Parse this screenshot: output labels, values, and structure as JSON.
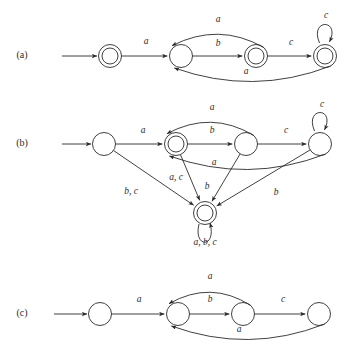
{
  "figure": {
    "background": "#ffffff",
    "ink": "#2b2b2b",
    "panels": [
      {
        "id": "a",
        "label": "(a)",
        "label_x": 22,
        "label_y": 56,
        "states": [
          {
            "name": "a-q0",
            "x": 110,
            "y": 56,
            "accepting": true
          },
          {
            "name": "a-q1",
            "x": 181,
            "y": 56,
            "accepting": false
          },
          {
            "name": "a-q2",
            "x": 256,
            "y": 56,
            "accepting": true
          },
          {
            "name": "a-q3",
            "x": 325,
            "y": 56,
            "accepting": true
          }
        ],
        "start_arrow": {
          "from_x": 62,
          "to_x": 97,
          "y": 56
        },
        "transitions": [
          {
            "name": "a-e1",
            "label": "a",
            "label_x": 146,
            "label_y": 42,
            "from": "a-q0",
            "to": "a-q1",
            "shape": "straight"
          },
          {
            "name": "a-e2",
            "label": "b",
            "label_x": 218,
            "label_y": 44,
            "from": "a-q1",
            "to": "a-q2",
            "shape": "straight"
          },
          {
            "name": "a-e3",
            "label": "c",
            "label_x": 291,
            "label_y": 43,
            "from": "a-q2",
            "to": "a-q3",
            "shape": "straight"
          },
          {
            "name": "a-e4",
            "label": "a",
            "label_x": 218,
            "label_y": 20,
            "from": "a-q2",
            "to": "a-q1",
            "shape": "arc-above"
          },
          {
            "name": "a-e5",
            "label": "a",
            "label_x": 246,
            "label_y": 72,
            "from": "a-q3",
            "to": "a-q1",
            "shape": "arc-below"
          },
          {
            "name": "a-e6",
            "label": "c",
            "label_x": 326,
            "label_y": 16,
            "from": "a-q3",
            "to": "a-q3",
            "shape": "self-loop-top"
          }
        ]
      },
      {
        "id": "b",
        "label": "(b)",
        "label_x": 22,
        "label_y": 144,
        "states": [
          {
            "name": "b-q0",
            "x": 104,
            "y": 144,
            "accepting": false
          },
          {
            "name": "b-q1",
            "x": 176,
            "y": 144,
            "accepting": true
          },
          {
            "name": "b-q2",
            "x": 246,
            "y": 144,
            "accepting": false
          },
          {
            "name": "b-q3",
            "x": 320,
            "y": 144,
            "accepting": false
          },
          {
            "name": "b-q4",
            "x": 205,
            "y": 213,
            "accepting": true
          }
        ],
        "start_arrow": {
          "from_x": 62,
          "to_x": 91,
          "y": 144
        },
        "transitions": [
          {
            "name": "b-e1",
            "label": "a",
            "label_x": 143,
            "label_y": 131,
            "from": "b-q0",
            "to": "b-q1",
            "shape": "straight"
          },
          {
            "name": "b-e2",
            "label": "b",
            "label_x": 212,
            "label_y": 131,
            "from": "b-q1",
            "to": "b-q2",
            "shape": "straight"
          },
          {
            "name": "b-e3",
            "label": "c",
            "label_x": 286,
            "label_y": 131,
            "from": "b-q2",
            "to": "b-q3",
            "shape": "straight"
          },
          {
            "name": "b-e4",
            "label": "a",
            "label_x": 212,
            "label_y": 108,
            "from": "b-q2",
            "to": "b-q1",
            "shape": "arc-above"
          },
          {
            "name": "b-e5",
            "label": "a",
            "label_x": 214,
            "label_y": 163,
            "from": "b-q3",
            "to": "b-q1",
            "shape": "arc-below"
          },
          {
            "name": "b-e6",
            "label": "c",
            "label_x": 322,
            "label_y": 105,
            "from": "b-q3",
            "to": "b-q3",
            "shape": "self-loop-top"
          },
          {
            "name": "b-e7",
            "label": "b, c",
            "label_x": 131,
            "label_y": 192,
            "from": "b-q0",
            "to": "b-q4",
            "shape": "straight"
          },
          {
            "name": "b-e8",
            "label": "a, c",
            "label_x": 176,
            "label_y": 178,
            "from": "b-q1",
            "to": "b-q4",
            "shape": "straight"
          },
          {
            "name": "b-e9",
            "label": "b",
            "label_x": 207,
            "label_y": 187,
            "from": "b-q2",
            "to": "b-q4",
            "shape": "straight"
          },
          {
            "name": "b-e10",
            "label": "b",
            "label_x": 276,
            "label_y": 193,
            "from": "b-q3",
            "to": "b-q4",
            "shape": "straight"
          },
          {
            "name": "b-e11",
            "label": "a, b, c",
            "label_x": 205,
            "label_y": 243,
            "from": "b-q4",
            "to": "b-q4",
            "shape": "self-loop-bottom"
          }
        ]
      },
      {
        "id": "c",
        "label": "(c)",
        "label_x": 22,
        "label_y": 314,
        "states": [
          {
            "name": "c-q0",
            "x": 100,
            "y": 314,
            "accepting": false
          },
          {
            "name": "c-q1",
            "x": 178,
            "y": 314,
            "accepting": false
          },
          {
            "name": "c-q2",
            "x": 243,
            "y": 314,
            "accepting": false
          },
          {
            "name": "c-q3",
            "x": 319,
            "y": 314,
            "accepting": false
          }
        ],
        "start_arrow": {
          "from_x": 54,
          "to_x": 87,
          "y": 314
        },
        "transitions": [
          {
            "name": "c-e1",
            "label": "a",
            "label_x": 139,
            "label_y": 300,
            "from": "c-q0",
            "to": "c-q1",
            "shape": "straight"
          },
          {
            "name": "c-e2",
            "label": "b",
            "label_x": 210,
            "label_y": 300,
            "from": "c-q1",
            "to": "c-q2",
            "shape": "straight"
          },
          {
            "name": "c-e3",
            "label": "c",
            "label_x": 283,
            "label_y": 300,
            "from": "c-q2",
            "to": "c-q3",
            "shape": "straight"
          },
          {
            "name": "c-e4",
            "label": "a",
            "label_x": 210,
            "label_y": 277,
            "from": "c-q2",
            "to": "c-q1",
            "shape": "arc-above"
          },
          {
            "name": "c-e5",
            "label": "a",
            "label_x": 239,
            "label_y": 330,
            "from": "c-q3",
            "to": "c-q1",
            "shape": "arc-below"
          }
        ]
      }
    ]
  }
}
